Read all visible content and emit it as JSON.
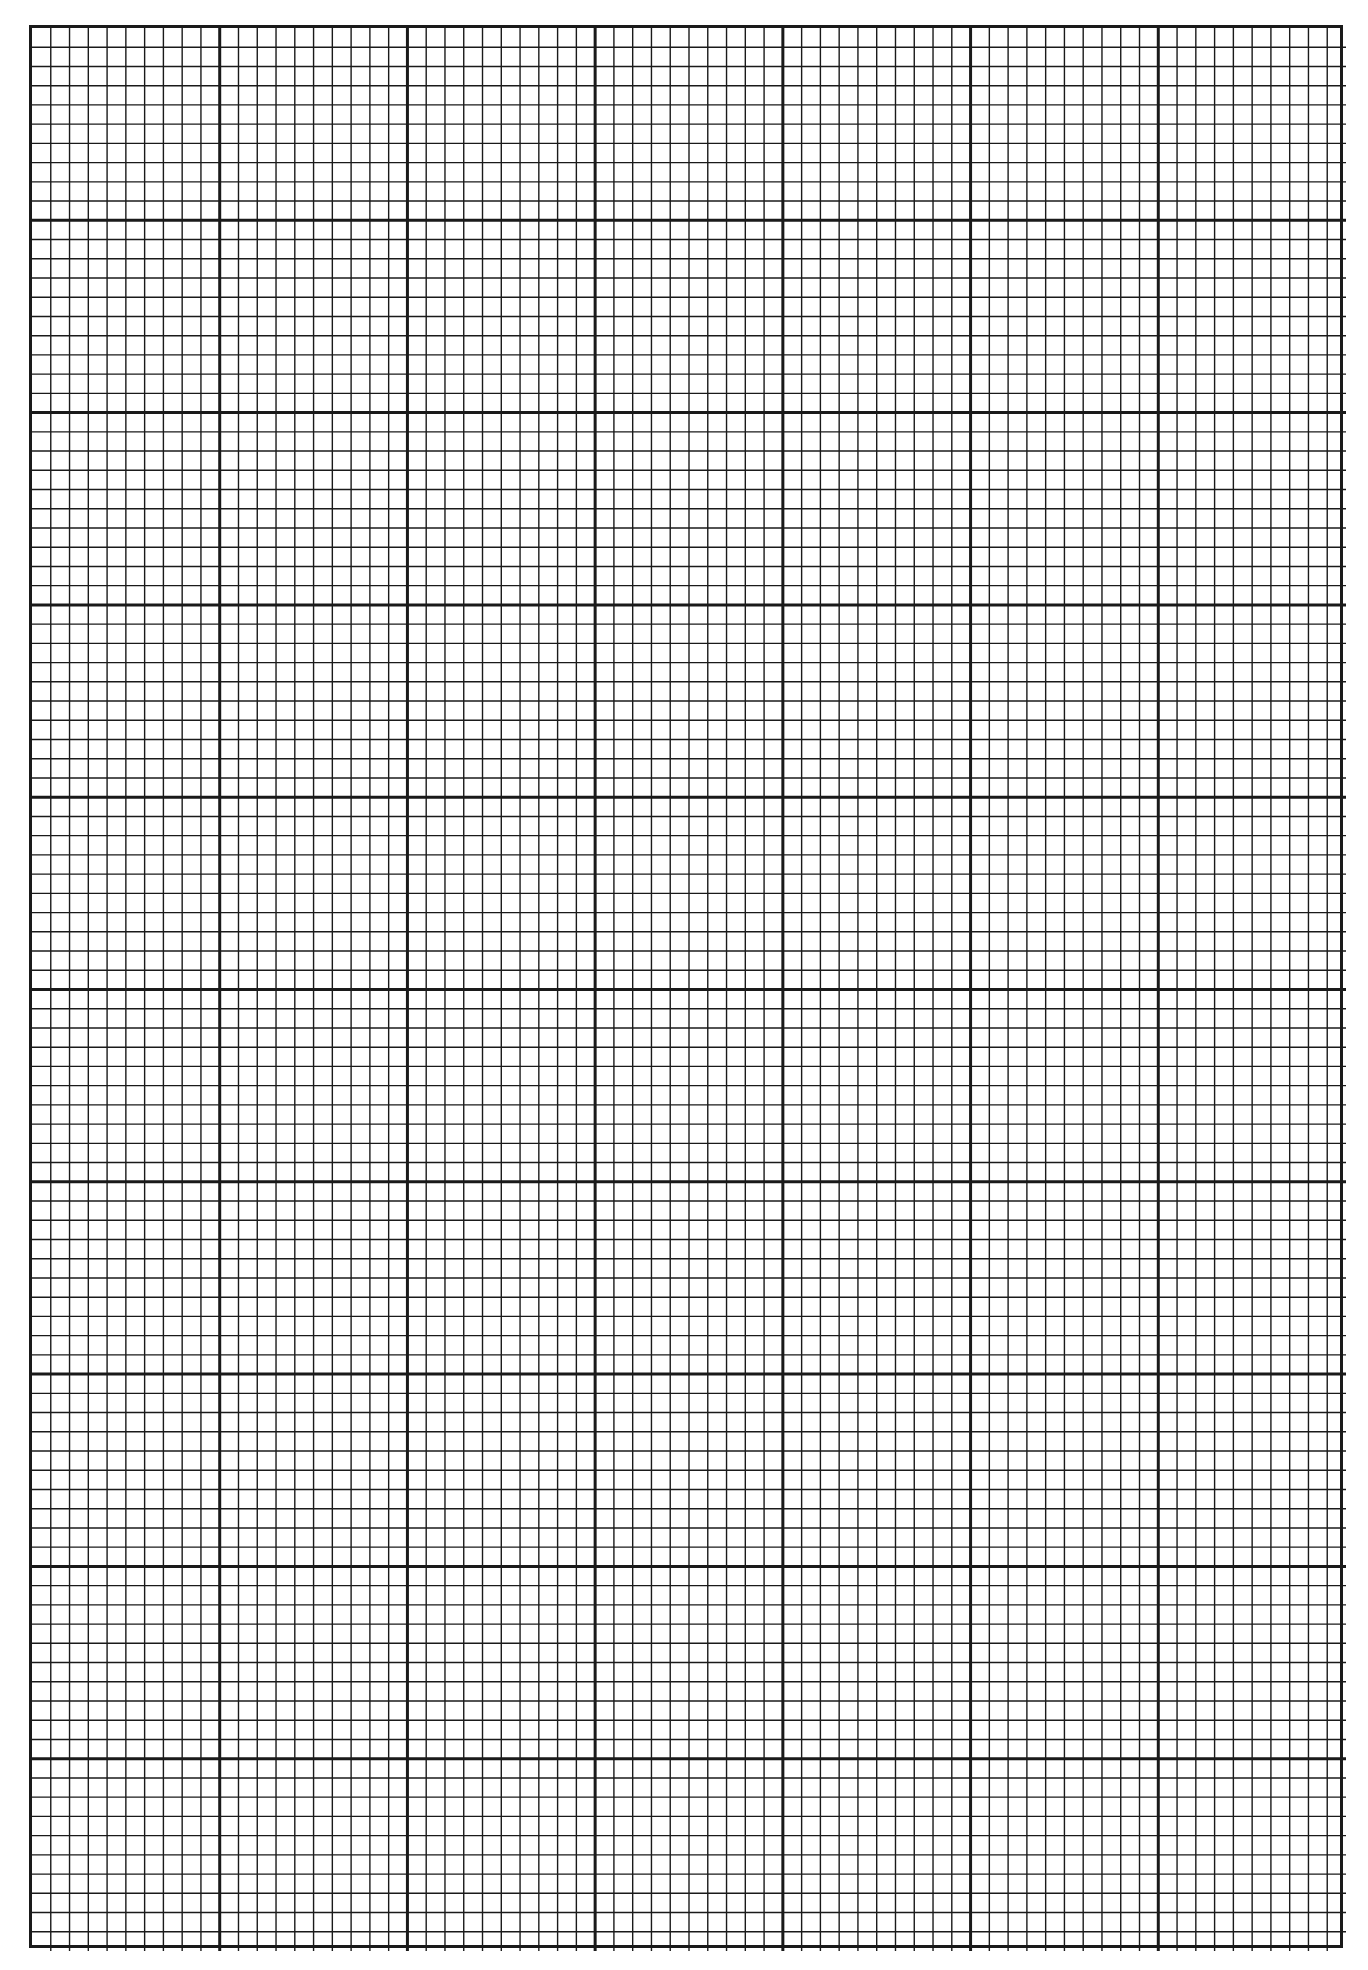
{
  "page": {
    "type": "graph-paper",
    "background": "#ffffff",
    "line_color": "#1a1a1a"
  },
  "grid": {
    "major_columns": 7,
    "major_rows": 10,
    "minor_per_major": 10,
    "minor_line_width": 1.4,
    "major_line_width": 3,
    "origin": {
      "x": 29,
      "y": 25
    },
    "size": {
      "width": 1314,
      "height": 1923
    }
  }
}
